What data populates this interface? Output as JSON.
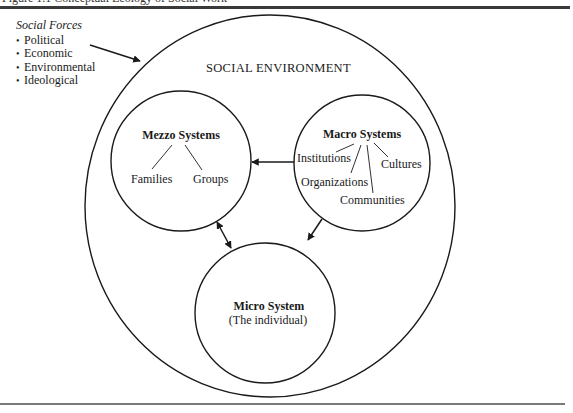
{
  "header": {
    "caption": "Figure 1.1 Conceptual Ecology of Social Work"
  },
  "social_forces": {
    "title": "Social Forces",
    "items": [
      "Political",
      "Economic",
      "Environmental",
      "Ideological"
    ]
  },
  "diagram": {
    "environment_label": "SOCIAL ENVIRONMENT",
    "mezzo": {
      "title": "Mezzo Systems",
      "children": [
        "Families",
        "Groups"
      ]
    },
    "macro": {
      "title": "Macro Systems",
      "children": [
        "Institutions",
        "Organizations",
        "Communities",
        "Cultures"
      ]
    },
    "micro": {
      "title": "Micro System",
      "subtitle": "(The individual)"
    },
    "relationships": [
      {
        "from": "Social Forces",
        "to": "Social Environment",
        "direction": "one-way"
      },
      {
        "from": "Macro Systems",
        "to": "Mezzo Systems",
        "direction": "one-way"
      },
      {
        "from": "Macro Systems",
        "to": "Micro System",
        "direction": "one-way"
      },
      {
        "from": "Mezzo Systems",
        "to": "Micro System",
        "direction": "two-way"
      }
    ]
  }
}
